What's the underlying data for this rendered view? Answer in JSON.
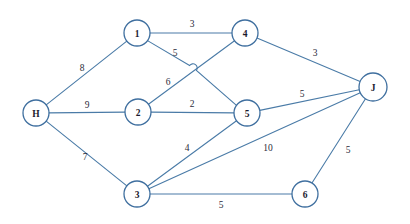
{
  "diagram": {
    "type": "undirected-weighted-graph",
    "colors": {
      "edge": "#4a7ba7",
      "node_stroke": "#3f6f9f",
      "node_fill": "#ffffff",
      "label_text": "#1a1a2e",
      "background": "#ffffff"
    },
    "nodes": [
      {
        "id": "H",
        "label": "H",
        "x": 36,
        "y": 113,
        "r": 13
      },
      {
        "id": "1",
        "label": "1",
        "x": 137,
        "y": 33,
        "r": 13
      },
      {
        "id": "2",
        "label": "2",
        "x": 138,
        "y": 112,
        "r": 13
      },
      {
        "id": "3",
        "label": "3",
        "x": 137,
        "y": 194,
        "r": 13
      },
      {
        "id": "4",
        "label": "4",
        "x": 245,
        "y": 33,
        "r": 13
      },
      {
        "id": "5",
        "label": "5",
        "x": 247,
        "y": 113,
        "r": 13
      },
      {
        "id": "6",
        "label": "6",
        "x": 305,
        "y": 194,
        "r": 13
      },
      {
        "id": "J",
        "label": "J",
        "x": 373,
        "y": 87,
        "r": 14
      }
    ],
    "edges": [
      {
        "id": "e-H-1",
        "from": "H",
        "to": "1",
        "weight": "8",
        "lx": 82,
        "ly": 68
      },
      {
        "id": "e-H-2",
        "from": "H",
        "to": "2",
        "weight": "9",
        "lx": 87,
        "ly": 105
      },
      {
        "id": "e-H-3",
        "from": "H",
        "to": "3",
        "weight": "7",
        "lx": 85,
        "ly": 157
      },
      {
        "id": "e-1-4",
        "from": "1",
        "to": "4",
        "weight": "3",
        "lx": 192,
        "ly": 24
      },
      {
        "id": "e-1-5",
        "from": "1",
        "to": "5",
        "weight": "5",
        "lx": 175,
        "ly": 53
      },
      {
        "id": "e-2-4",
        "from": "2",
        "to": "4",
        "weight": "6",
        "lx": 168,
        "ly": 82
      },
      {
        "id": "e-2-5",
        "from": "2",
        "to": "5",
        "weight": "2",
        "lx": 192,
        "ly": 104
      },
      {
        "id": "e-3-5",
        "from": "3",
        "to": "5",
        "weight": "4",
        "lx": 187,
        "ly": 148
      },
      {
        "id": "e-3-J",
        "from": "3",
        "to": "J",
        "weight": "10",
        "lx": 268,
        "ly": 148
      },
      {
        "id": "e-3-6",
        "from": "3",
        "to": "6",
        "weight": "5",
        "lx": 221,
        "ly": 205
      },
      {
        "id": "e-4-J",
        "from": "4",
        "to": "J",
        "weight": "3",
        "lx": 315,
        "ly": 53
      },
      {
        "id": "e-5-J",
        "from": "5",
        "to": "J",
        "weight": "5",
        "lx": 302,
        "ly": 94
      },
      {
        "id": "e-6-J",
        "from": "6",
        "to": "J",
        "weight": "5",
        "lx": 348,
        "ly": 150
      }
    ],
    "crossing": {
      "note": "edge 1-5 hops over edge 2-4",
      "x": 193,
      "y": 68
    }
  }
}
